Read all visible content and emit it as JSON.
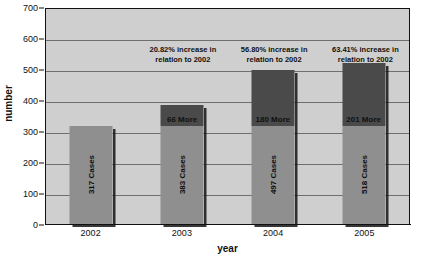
{
  "chart_data": {
    "type": "bar",
    "title": "",
    "xlabel": "year",
    "ylabel": "number",
    "categories": [
      "2002",
      "2003",
      "2004",
      "2005"
    ],
    "values": [
      317,
      383,
      497,
      518
    ],
    "ylim": [
      0,
      700
    ],
    "yticks": [
      0,
      100,
      200,
      300,
      400,
      500,
      600,
      700
    ],
    "grid": true,
    "legend": "none",
    "series": [
      {
        "name": "Baseline cases",
        "values": [
          317,
          317,
          317,
          317
        ]
      },
      {
        "name": "Increase over 2002",
        "values": [
          0,
          66,
          180,
          201
        ]
      }
    ],
    "bar_value_labels": [
      "317 Cases",
      "383 Cases",
      "497 Cases",
      "518 Cases"
    ],
    "bar_increment_labels": [
      "",
      "66 More",
      "180 More",
      "201 More"
    ],
    "annotations": [
      "",
      "20.82% increase in relation to 2002",
      "56.80% increase in relation to 2002",
      "63.41% increase in relation to 2002"
    ],
    "colors": {
      "plot_background": "#cfcfcf",
      "gridline": "#6f6f6f",
      "bar_base": "#8f8f8f",
      "bar_increment": "#4a4a4a",
      "axis": "#111111",
      "text": "#111111"
    }
  }
}
